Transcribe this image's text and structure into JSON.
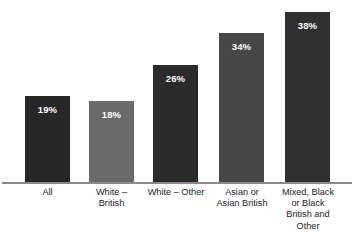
{
  "chart_data": {
    "type": "bar",
    "title": "",
    "xlabel": "",
    "ylabel": "",
    "ylim": [
      0,
      45
    ],
    "grid": false,
    "legend": "none",
    "orientation": "vertical",
    "value_labels_inside_bars": true,
    "categories": [
      "All",
      "White –\nBritish",
      "White – Other",
      "Asian or\nAsian British",
      "Mixed, Black\nor Black\nBritish and\nOther"
    ],
    "values": [
      19,
      18,
      26,
      34,
      38
    ],
    "value_labels": [
      "19%",
      "18%",
      "26%",
      "34%",
      "38%"
    ],
    "bar_colors": [
      "#272727",
      "#6a6a6a",
      "#2b2b2b",
      "#474747",
      "#303030"
    ],
    "axis_color": "#8a8a8a",
    "value_label_color": "#ffffff",
    "background_color": "#ffffff"
  },
  "bars": [
    {
      "category": "All",
      "value_label": "19%",
      "value": 19,
      "color": "#272727",
      "left": 25,
      "width": 45,
      "top": 95
    },
    {
      "category": "White –\nBritish",
      "value_label": "18%",
      "value": 18,
      "color": "#6a6a6a",
      "left": 89,
      "width": 45,
      "top": 100
    },
    {
      "category": "White – Other",
      "value_label": "26%",
      "value": 26,
      "color": "#2b2b2b",
      "left": 153,
      "width": 45,
      "top": 64
    },
    {
      "category": "Asian or\nAsian British",
      "value_label": "34%",
      "value": 34,
      "color": "#474747",
      "left": 219,
      "width": 45,
      "top": 32
    },
    {
      "category": "Mixed, Black\nor Black\nBritish and\nOther",
      "value_label": "38%",
      "value": 38,
      "color": "#303030",
      "left": 285,
      "width": 45,
      "top": 11
    }
  ],
  "category_labels": [
    {
      "text": "All",
      "left": 10,
      "width": 75
    },
    {
      "text": "White –\nBritish",
      "left": 74,
      "width": 75
    },
    {
      "text": "White – Other",
      "left": 136,
      "width": 80
    },
    {
      "text": "Asian or\nAsian British",
      "left": 203,
      "width": 78
    },
    {
      "text": "Mixed, Black\nor Black\nBritish and\nOther",
      "left": 269,
      "width": 78
    }
  ]
}
